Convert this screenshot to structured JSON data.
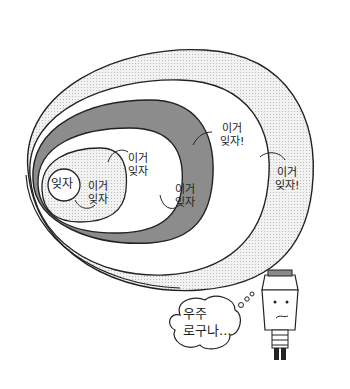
{
  "colors": {
    "outline": "#222222",
    "dotted_fill": "#e6e6e6",
    "dark_band": "#8c8c8c",
    "inner_dotted": "#ececec",
    "white": "#ffffff",
    "bin_lid": "#8a8a8a"
  },
  "diagram": {
    "core_label": "잊자",
    "rings": [
      {
        "label": "이거\n잊자"
      },
      {
        "label": "이거\n잊자"
      },
      {
        "label": "이거\n잊자"
      },
      {
        "label": "이거\n잊자!"
      },
      {
        "label": "이거\n잊자!"
      }
    ]
  },
  "character": {
    "thought": "우주\n로구나..."
  }
}
